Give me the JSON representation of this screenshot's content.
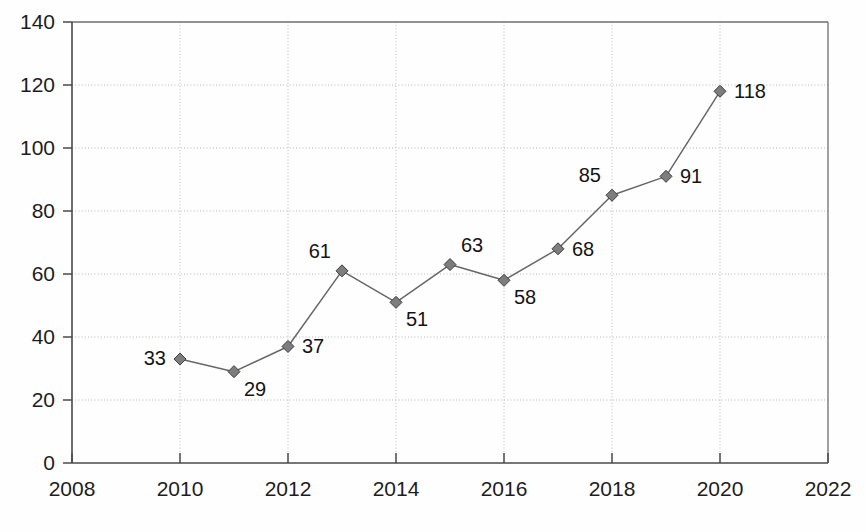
{
  "chart_data": {
    "type": "line",
    "title": "",
    "subtitle": "",
    "xlabel": "",
    "ylabel": "",
    "x": [
      2010,
      2011,
      2012,
      2013,
      2014,
      2015,
      2016,
      2017,
      2018,
      2019,
      2020
    ],
    "values": [
      33,
      29,
      37,
      61,
      51,
      63,
      58,
      68,
      85,
      91,
      118
    ],
    "data_labels": [
      "33",
      "29",
      "37",
      "61",
      "51",
      "63",
      "58",
      "68",
      "85",
      "91",
      "118"
    ],
    "label_positions": [
      "left",
      "below-right",
      "right",
      "above-left",
      "below-right",
      "above-right",
      "below-right",
      "right",
      "above-left",
      "right",
      "right"
    ],
    "xlim": [
      2008,
      2022
    ],
    "ylim": [
      0,
      140
    ],
    "x_ticks": [
      2008,
      2010,
      2012,
      2014,
      2016,
      2018,
      2020,
      2022
    ],
    "x_tick_labels": [
      "2008",
      "2010",
      "2012",
      "2014",
      "2016",
      "2018",
      "2020",
      "2022"
    ],
    "y_ticks": [
      0,
      20,
      40,
      60,
      80,
      100,
      120,
      140
    ],
    "y_tick_labels": [
      "0",
      "20",
      "40",
      "60",
      "80",
      "100",
      "120",
      "140"
    ],
    "grid": true,
    "grid_style": "dotted",
    "legend": false,
    "legend_position": "none",
    "marker": "diamond",
    "series": [
      {
        "name": "",
        "values": [
          33,
          29,
          37,
          61,
          51,
          63,
          58,
          68,
          85,
          91,
          118
        ]
      }
    ]
  },
  "colors": {
    "background": "#fefefe",
    "axis": "#4a4a4a",
    "frame": "#6e6e6e",
    "grid": "#b9b9b9",
    "line": "#676767",
    "marker_fill": "#7d7d7d",
    "marker_stroke": "#3c3c3c",
    "text": "#1d1d1d"
  }
}
